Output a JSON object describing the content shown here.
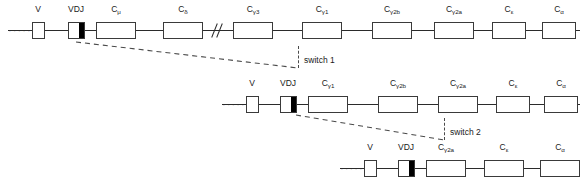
{
  "diagram": {
    "leader_dots": "·····",
    "rows": [
      {
        "id": "germline-locus",
        "name": "row-1-germline-locus",
        "segments": [
          {
            "label": "V",
            "sub": "",
            "kind": "v"
          },
          {
            "label": "VDJ",
            "sub": "",
            "kind": "vdj"
          },
          {
            "label": "C",
            "sub": "μ",
            "kind": "c"
          },
          {
            "label": "C",
            "sub": "δ",
            "kind": "c"
          },
          {
            "label": "C",
            "sub": "γ3",
            "kind": "c"
          },
          {
            "label": "C",
            "sub": "γ1",
            "kind": "c"
          },
          {
            "label": "C",
            "sub": "γ2b",
            "kind": "c"
          },
          {
            "label": "C",
            "sub": "γ2a",
            "kind": "c"
          },
          {
            "label": "C",
            "sub": "ε",
            "kind": "c"
          },
          {
            "label": "C",
            "sub": "α",
            "kind": "c"
          }
        ]
      },
      {
        "id": "after-switch-1",
        "name": "row-2-after-switch-1",
        "segments": [
          {
            "label": "V",
            "sub": "",
            "kind": "v"
          },
          {
            "label": "VDJ",
            "sub": "",
            "kind": "vdj"
          },
          {
            "label": "C",
            "sub": "γ1",
            "kind": "c"
          },
          {
            "label": "C",
            "sub": "γ2b",
            "kind": "c"
          },
          {
            "label": "C",
            "sub": "γ2a",
            "kind": "c"
          },
          {
            "label": "C",
            "sub": "ε",
            "kind": "c"
          },
          {
            "label": "C",
            "sub": "α",
            "kind": "c"
          }
        ]
      },
      {
        "id": "after-switch-2",
        "name": "row-3-after-switch-2",
        "segments": [
          {
            "label": "V",
            "sub": "",
            "kind": "v"
          },
          {
            "label": "VDJ",
            "sub": "",
            "kind": "vdj"
          },
          {
            "label": "C",
            "sub": "γ2a",
            "kind": "c"
          },
          {
            "label": "C",
            "sub": "ε",
            "kind": "c"
          },
          {
            "label": "C",
            "sub": "α",
            "kind": "c"
          }
        ]
      }
    ],
    "annotations": [
      {
        "id": "switch-1",
        "label": "switch 1"
      },
      {
        "id": "switch-2",
        "label": "switch 2"
      }
    ],
    "colors": {
      "line": "#2b2b2b",
      "box_stroke": "#3a3a3a",
      "box_fill": "#ffffff",
      "vdj_bar": "#000000",
      "dashed": "#4a4a4a",
      "text": "#1a1a1a",
      "background": "#ffffff"
    }
  }
}
